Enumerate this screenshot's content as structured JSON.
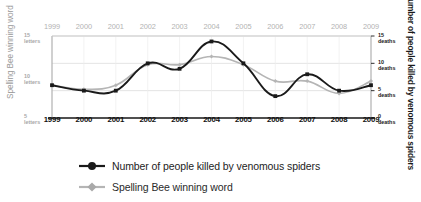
{
  "chart_data": {
    "type": "line",
    "title": "",
    "categories": [
      "1999",
      "2000",
      "2001",
      "2002",
      "2003",
      "2004",
      "2005",
      "2006",
      "2007",
      "2008",
      "2009"
    ],
    "x": [
      1999,
      2000,
      2001,
      2002,
      2003,
      2004,
      2005,
      2006,
      2007,
      2008,
      2009
    ],
    "grid": true,
    "legend_position": "bottom-left",
    "series": [
      {
        "name": "Number of people killed by venomous spiders",
        "color": "#1a1a1a",
        "axis": "right",
        "unit": "deaths",
        "values": [
          6,
          5,
          5,
          10,
          9,
          14,
          10,
          4,
          8,
          5,
          6
        ]
      },
      {
        "name": "Spelling Bee winning word",
        "color": "#b5b5b5",
        "axis": "left",
        "unit": "letters",
        "values": [
          9,
          8.5,
          9,
          11.5,
          11.5,
          12.5,
          11.5,
          9.5,
          9.5,
          8,
          9.5
        ]
      }
    ],
    "left_axis": {
      "label": "Spelling Bee winning word",
      "unit": "letters",
      "ticks": [
        {
          "num": "15",
          "unit": "letters"
        },
        {
          "num": "10",
          "unit": "letters"
        },
        {
          "num": "5",
          "unit": "letters"
        }
      ],
      "ylim": [
        5,
        15
      ]
    },
    "right_axis": {
      "label": "Number of people killed by venomous spiders",
      "unit": "deaths",
      "ticks": [
        {
          "num": "15",
          "unit": "deaths"
        },
        {
          "num": "10",
          "unit": "deaths"
        },
        {
          "num": "5",
          "unit": "deaths"
        },
        {
          "num": "0",
          "unit": "deaths"
        }
      ],
      "ylim": [
        0,
        15
      ]
    },
    "xlabel": "",
    "ylabel": "Spelling Bee winning word"
  },
  "legend": {
    "items": [
      {
        "label": "Number of people killed by venomous spiders",
        "color": "#1a1a1a",
        "marker": "circle"
      },
      {
        "label": "Spelling Bee winning word",
        "color": "#b5b5b5",
        "marker": "diamond"
      }
    ]
  },
  "colors": {
    "series_black": "#1a1a1a",
    "series_grey": "#b5b5b5",
    "grid": "#dcdcdc",
    "axis": "#9e9e9e",
    "tick_top": "#b3b3b3",
    "tick_bottom": "#111111",
    "background": "#ffffff"
  }
}
